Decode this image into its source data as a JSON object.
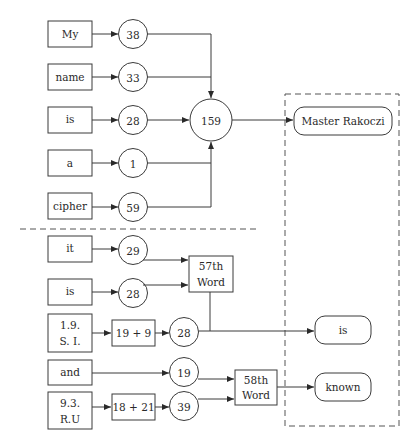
{
  "colors": {
    "stroke": "#3a3a3a",
    "text": "#2a2a2a",
    "background": "#ffffff"
  },
  "upper": {
    "words": [
      {
        "label": "My",
        "value": "38"
      },
      {
        "label": "name",
        "value": "33"
      },
      {
        "label": "is",
        "value": "28"
      },
      {
        "label": "a",
        "value": "1"
      },
      {
        "label": "cipher",
        "value": "59"
      }
    ],
    "sum": "159",
    "result": "Master Rakoczi"
  },
  "lower": {
    "inputs": [
      {
        "label": "it",
        "value": "29"
      },
      {
        "label": "is",
        "value": "28"
      },
      {
        "label_line1": "1.9.",
        "label_line2": "S. I.",
        "expr": "19 + 9",
        "value": "28"
      },
      {
        "label": "and",
        "value": "19"
      },
      {
        "label_line1": "9.3.",
        "label_line2": "R.U",
        "expr": "18 + 21",
        "value": "39"
      }
    ],
    "word57": {
      "line1": "57th",
      "line2": "Word"
    },
    "word58": {
      "line1": "58th",
      "line2": "Word"
    },
    "results": [
      "is",
      "known"
    ]
  }
}
